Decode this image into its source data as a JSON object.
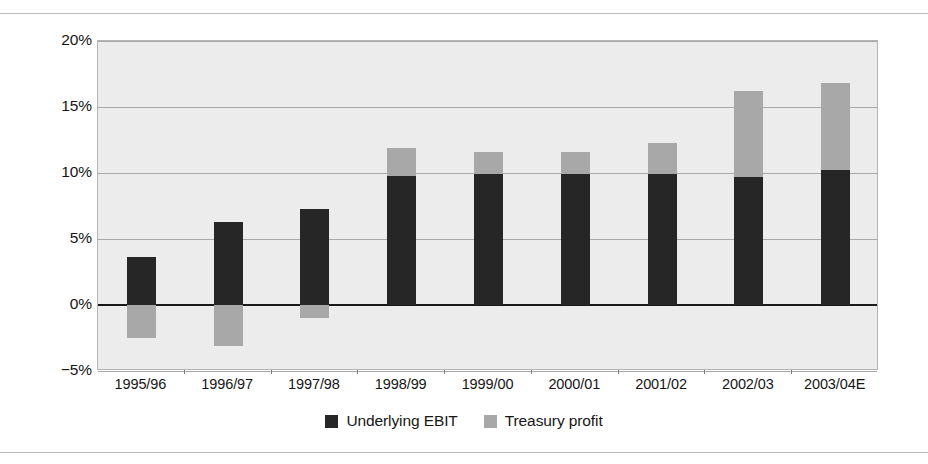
{
  "chart_data": {
    "type": "bar",
    "title": "",
    "subtitle": "",
    "xlabel": "",
    "ylabel": "",
    "stacked": true,
    "grid": true,
    "legend_position": "bottom",
    "ylim": [
      -5,
      20
    ],
    "yticks": [
      20,
      15,
      10,
      5,
      0,
      -5
    ],
    "ytick_labels": [
      "20%",
      "15%",
      "10%",
      "5%",
      "0%",
      "−5%"
    ],
    "categories": [
      "1995/96",
      "1996/97",
      "1997/98",
      "1998/99",
      "1999/00",
      "2000/01",
      "2001/02",
      "2002/03",
      "2003/04E"
    ],
    "series": [
      {
        "name": "Underlying EBIT",
        "color": "#262626",
        "values": [
          3.6,
          6.3,
          7.3,
          9.8,
          9.9,
          9.9,
          9.9,
          9.7,
          10.2
        ]
      },
      {
        "name": "Treasury profit",
        "color": "#a8a8a8",
        "values": [
          -2.5,
          -3.1,
          -1.0,
          2.1,
          1.7,
          1.7,
          2.4,
          6.5,
          6.6
        ]
      }
    ],
    "totals": [
      1.1,
      3.2,
      6.3,
      11.9,
      11.6,
      11.6,
      12.3,
      16.2,
      16.8
    ]
  },
  "legend": {
    "items": [
      {
        "label": "Underlying EBIT",
        "color": "#262626",
        "swatch": "dark-square-swatch"
      },
      {
        "label": "Treasury profit",
        "color": "#a8a8a8",
        "swatch": "light-square-swatch"
      }
    ]
  },
  "colors": {
    "plot_background": "#ececec",
    "gridline": "#a9a9a9",
    "zeroline": "#1a1a1a",
    "page_background": "#ffffff",
    "rule": "#b9bcc0",
    "text": "#161616"
  }
}
